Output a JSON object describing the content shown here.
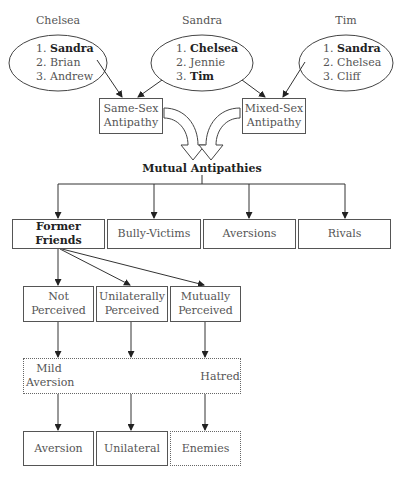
{
  "people": [
    {
      "name": "Chelsea",
      "list": [
        {
          "rank": "1.",
          "name": "Sandra",
          "bold": true
        },
        {
          "rank": "2.",
          "name": "Brian",
          "bold": false
        },
        {
          "rank": "3.",
          "name": "Andrew",
          "bold": false
        }
      ]
    },
    {
      "name": "Sandra",
      "list": [
        {
          "rank": "1.",
          "name": "Chelsea",
          "bold": true
        },
        {
          "rank": "2.",
          "name": "Jennie",
          "bold": false
        },
        {
          "rank": "3.",
          "name": "Tim",
          "bold": true
        }
      ]
    },
    {
      "name": "Tim",
      "list": [
        {
          "rank": "1.",
          "name": "Sandra",
          "bold": true
        },
        {
          "rank": "2.",
          "name": "Chelsea",
          "bold": false
        },
        {
          "rank": "3.",
          "name": "Cliff",
          "bold": false
        }
      ]
    }
  ],
  "antipathy": {
    "same_sex": [
      "Same-Sex",
      "Antipathy"
    ],
    "mixed_sex": [
      "Mixed-Sex",
      "Antipathy"
    ]
  },
  "mutual_title": "Mutual Antipathies",
  "categories": [
    "Former Friends",
    "Bully-Victims",
    "Aversions",
    "Rivals"
  ],
  "perception": [
    [
      "Not",
      "Perceived"
    ],
    [
      "Unilaterally",
      "Perceived"
    ],
    [
      "Mutually",
      "Perceived"
    ]
  ],
  "continuum": {
    "left": [
      "Mild",
      "Aversion"
    ],
    "right": "Hatred"
  },
  "outcomes": [
    "Aversion",
    "Unilateral",
    "Enemies"
  ]
}
